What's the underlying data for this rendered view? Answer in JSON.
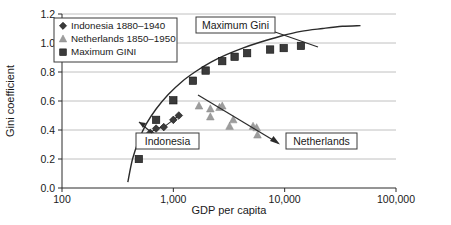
{
  "chart_data": {
    "type": "scatter",
    "title": "",
    "xlabel": "GDP per capita",
    "ylabel": "Gini coefficient",
    "xscale": "log",
    "xlim": [
      100,
      100000
    ],
    "ylim": [
      0.0,
      1.2
    ],
    "grid": "horizontal",
    "xticks": [
      "100",
      "1,000",
      "10,000",
      "100,000"
    ],
    "xtick_values": [
      100,
      1000,
      10000,
      100000
    ],
    "yticks": [
      "0.0",
      "0.2",
      "0.4",
      "0.6",
      "0.8",
      "1.0",
      "1.2"
    ],
    "ytick_values": [
      0.0,
      0.2,
      0.4,
      0.6,
      0.8,
      1.0,
      1.2
    ],
    "legend_position": "top-left",
    "series": [
      {
        "name": "Indonesia 1880–1940",
        "marker": "diamond",
        "color": "#3b3b3b",
        "connected": true,
        "points": [
          {
            "x": 620,
            "y": 0.38
          },
          {
            "x": 700,
            "y": 0.41
          },
          {
            "x": 820,
            "y": 0.42
          },
          {
            "x": 1000,
            "y": 0.47
          },
          {
            "x": 1120,
            "y": 0.5
          }
        ]
      },
      {
        "name": "Netherlands 1850–1950",
        "marker": "triangle",
        "color": "#9d9d9d",
        "connected": false,
        "points": [
          {
            "x": 1700,
            "y": 0.565
          },
          {
            "x": 2150,
            "y": 0.545
          },
          {
            "x": 2600,
            "y": 0.555
          },
          {
            "x": 2750,
            "y": 0.565
          },
          {
            "x": 2150,
            "y": 0.49
          },
          {
            "x": 3200,
            "y": 0.425
          },
          {
            "x": 3450,
            "y": 0.47
          },
          {
            "x": 5200,
            "y": 0.425
          },
          {
            "x": 5600,
            "y": 0.415
          },
          {
            "x": 5700,
            "y": 0.365
          }
        ]
      },
      {
        "name": "Maximum GINI",
        "marker": "square",
        "color": "#3b3b3b",
        "connected": false,
        "points": [
          {
            "x": 490,
            "y": 0.2
          },
          {
            "x": 700,
            "y": 0.47
          },
          {
            "x": 1000,
            "y": 0.605
          },
          {
            "x": 1500,
            "y": 0.74
          },
          {
            "x": 1950,
            "y": 0.81
          },
          {
            "x": 2750,
            "y": 0.875
          },
          {
            "x": 3550,
            "y": 0.905
          },
          {
            "x": 4600,
            "y": 0.93
          },
          {
            "x": 7400,
            "y": 0.955
          },
          {
            "x": 9800,
            "y": 0.965
          },
          {
            "x": 14000,
            "y": 0.98
          }
        ]
      }
    ],
    "curve": {
      "name": "Maximum Gini curve",
      "color": "#2b2b2b",
      "points": [
        {
          "x": 390,
          "y": 0.04
        },
        {
          "x": 430,
          "y": 0.2
        },
        {
          "x": 490,
          "y": 0.33
        },
        {
          "x": 570,
          "y": 0.44
        },
        {
          "x": 700,
          "y": 0.545
        },
        {
          "x": 900,
          "y": 0.645
        },
        {
          "x": 1200,
          "y": 0.735
        },
        {
          "x": 1600,
          "y": 0.805
        },
        {
          "x": 2200,
          "y": 0.87
        },
        {
          "x": 3000,
          "y": 0.92
        },
        {
          "x": 4200,
          "y": 0.965
        },
        {
          "x": 6000,
          "y": 1.005
        },
        {
          "x": 9000,
          "y": 1.045
        },
        {
          "x": 14000,
          "y": 1.08
        },
        {
          "x": 22000,
          "y": 1.1
        },
        {
          "x": 33000,
          "y": 1.115
        },
        {
          "x": 48000,
          "y": 1.12
        }
      ]
    },
    "annotations": [
      {
        "label": "Maximum Gini",
        "box": true
      },
      {
        "label": "Indonesia",
        "box": true
      },
      {
        "label": "Netherlands",
        "box": true
      }
    ]
  },
  "legend": {
    "items": [
      {
        "label": "Indonesia 1880–1940",
        "marker": "diamond"
      },
      {
        "label": "Netherlands 1850–1950",
        "marker": "triangle"
      },
      {
        "label": "Maximum GINI",
        "marker": "square"
      }
    ]
  },
  "annotations": {
    "maximum_gini": "Maximum Gini",
    "indonesia": "Indonesia",
    "netherlands": "Netherlands"
  },
  "axes": {
    "x_title": "GDP per capita",
    "y_title": "Gini coefficient",
    "x_ticks": [
      "100",
      "1,000",
      "10,000",
      "100,000"
    ],
    "y_ticks": [
      "0.0",
      "0.2",
      "0.4",
      "0.6",
      "0.8",
      "1.0",
      "1.2"
    ]
  },
  "colors": {
    "dark_marker": "#3b3b3b",
    "light_marker": "#9d9d9d",
    "axis": "#2b2b2b",
    "grid": "#b9b9b9",
    "background": "#ffffff"
  }
}
